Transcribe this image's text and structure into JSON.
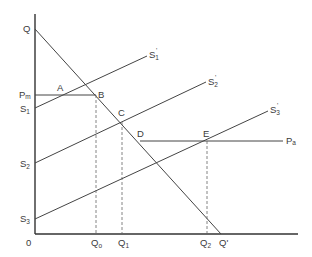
{
  "diagram": {
    "type": "supply-demand",
    "colors": {
      "line": "#444444",
      "axis": "#333333",
      "text": "#3a3a3a",
      "background": "#ffffff"
    },
    "origin_label": "0",
    "y_axis_labels": {
      "Q": "Q",
      "Pm": {
        "main": "P",
        "sub": "m"
      },
      "S1": {
        "main": "S",
        "sub": "1"
      },
      "S2": {
        "main": "S",
        "sub": "2"
      },
      "S3": {
        "main": "S",
        "sub": "3"
      }
    },
    "x_axis_labels": {
      "Q0": {
        "main": "Q",
        "sub": "o"
      },
      "Q1": {
        "main": "Q",
        "sub": "1"
      },
      "Q2": {
        "main": "Q",
        "sub": "2"
      },
      "Qprime": "Q'"
    },
    "curve_end_labels": {
      "S1prime": {
        "main": "S",
        "sub": "1",
        "prime": "'"
      },
      "S2prime": {
        "main": "S",
        "sub": "2",
        "prime": "'"
      },
      "S3prime": {
        "main": "S",
        "sub": "3",
        "prime": "'"
      },
      "Pa": {
        "main": "P",
        "sub": "a"
      }
    },
    "points": {
      "A": "A",
      "B": "B",
      "C": "C",
      "D": "D",
      "E": "E"
    },
    "lines": [
      {
        "name": "demand",
        "from": "Q",
        "to": "Q'"
      },
      {
        "name": "supply-1",
        "from": "S1",
        "to": "S1'"
      },
      {
        "name": "supply-2",
        "from": "S2",
        "to": "S2'"
      },
      {
        "name": "supply-3",
        "from": "S3",
        "to": "S3'"
      },
      {
        "name": "price-Pm",
        "from": "Pm",
        "to": "B"
      },
      {
        "name": "price-Pa",
        "from": "D",
        "to": "Pa"
      }
    ]
  }
}
